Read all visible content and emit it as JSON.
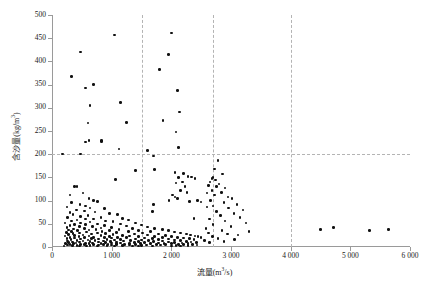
{
  "chart_data": {
    "type": "scatter",
    "title": "",
    "xlabel": "流量 (m³/s)",
    "ylabel": "含沙量 (kg/m³)",
    "xlabel_text": "流量",
    "xlabel_unit_base": "(m",
    "xlabel_unit_sup": "3",
    "xlabel_unit_tail": "/s)",
    "ylabel_text": "含沙量",
    "ylabel_unit_base": "(kg/m",
    "ylabel_unit_sup": "3",
    "ylabel_unit_tail": ")",
    "xlim": [
      0,
      6000
    ],
    "ylim": [
      0,
      500
    ],
    "xticks": [
      0,
      1000,
      2000,
      3000,
      4000,
      5000,
      6000
    ],
    "xtick_labels": [
      "0",
      "1 000",
      "2 000",
      "3 000",
      "4 000",
      "5 000",
      "6 000"
    ],
    "yticks": [
      0,
      50,
      100,
      150,
      200,
      250,
      300,
      350,
      400,
      450,
      500
    ],
    "ytick_labels": [
      "0",
      "50",
      "100",
      "150",
      "200",
      "250",
      "300",
      "350",
      "400",
      "450",
      "500"
    ],
    "grid": false,
    "legend": null,
    "marker": "filled-circle",
    "marker_color": "#111111",
    "axis_color": "#9a9a9a",
    "reference_lines": {
      "vertical": [
        {
          "x": 1500,
          "style": "dashed",
          "color": "#b4b4b4"
        },
        {
          "x": 2700,
          "style": "dashed",
          "color": "#b4b4b4"
        },
        {
          "x": 4000,
          "style": "dashed",
          "color": "#b4b4b4"
        }
      ],
      "horizontal": [
        {
          "y": 200,
          "style": "dashed",
          "color": "#b4b4b4"
        }
      ]
    },
    "points": [
      [
        480,
        420
      ],
      [
        330,
        367
      ],
      [
        560,
        343
      ],
      [
        700,
        350
      ],
      [
        1050,
        457
      ],
      [
        640,
        305
      ],
      [
        1150,
        312
      ],
      [
        600,
        267
      ],
      [
        1250,
        268
      ],
      [
        620,
        229
      ],
      [
        830,
        230
      ],
      [
        2000,
        461
      ],
      [
        1800,
        382
      ],
      [
        1950,
        415
      ],
      [
        2100,
        337
      ],
      [
        2140,
        291
      ],
      [
        1860,
        272
      ],
      [
        2080,
        248
      ],
      [
        2120,
        214
      ],
      [
        560,
        226
      ],
      [
        830,
        228
      ],
      [
        1120,
        211
      ],
      [
        1600,
        208
      ],
      [
        180,
        200
      ],
      [
        480,
        200
      ],
      [
        1700,
        196
      ],
      [
        1400,
        165
      ],
      [
        1720,
        167
      ],
      [
        1060,
        146
      ],
      [
        2060,
        160
      ],
      [
        2200,
        158
      ],
      [
        2120,
        150
      ],
      [
        2280,
        152
      ],
      [
        2340,
        151
      ],
      [
        2190,
        140
      ],
      [
        2400,
        148
      ],
      [
        2080,
        138
      ],
      [
        2230,
        131
      ],
      [
        2020,
        112
      ],
      [
        2060,
        108
      ],
      [
        2100,
        104
      ],
      [
        1960,
        100
      ],
      [
        2300,
        98
      ],
      [
        2440,
        100
      ],
      [
        2500,
        97
      ],
      [
        1700,
        92
      ],
      [
        1680,
        76
      ],
      [
        2380,
        61
      ],
      [
        2600,
        86
      ],
      [
        2150,
        122
      ],
      [
        2260,
        118
      ],
      [
        380,
        131
      ],
      [
        420,
        130
      ],
      [
        300,
        112
      ],
      [
        520,
        116
      ],
      [
        620,
        105
      ],
      [
        700,
        100
      ],
      [
        760,
        98
      ],
      [
        330,
        96
      ],
      [
        470,
        92
      ],
      [
        560,
        88
      ],
      [
        250,
        86
      ],
      [
        640,
        84
      ],
      [
        880,
        83
      ],
      [
        410,
        80
      ],
      [
        540,
        78
      ],
      [
        720,
        75
      ],
      [
        300,
        74
      ],
      [
        960,
        72
      ],
      [
        1100,
        70
      ],
      [
        350,
        70
      ],
      [
        600,
        68
      ],
      [
        480,
        66
      ],
      [
        820,
        64
      ],
      [
        260,
        64
      ],
      [
        1180,
        62
      ],
      [
        700,
        60
      ],
      [
        560,
        60
      ],
      [
        420,
        58
      ],
      [
        1280,
        58
      ],
      [
        900,
        56
      ],
      [
        330,
        56
      ],
      [
        1020,
        55
      ],
      [
        640,
        54
      ],
      [
        480,
        52
      ],
      [
        1400,
        52
      ],
      [
        220,
        52
      ],
      [
        760,
        50
      ],
      [
        1150,
        50
      ],
      [
        560,
        48
      ],
      [
        380,
        48
      ],
      [
        1500,
        47
      ],
      [
        880,
        46
      ],
      [
        300,
        46
      ],
      [
        1250,
        45
      ],
      [
        680,
        44
      ],
      [
        460,
        44
      ],
      [
        1600,
        43
      ],
      [
        1000,
        42
      ],
      [
        250,
        42
      ],
      [
        820,
        41
      ],
      [
        1350,
        40
      ],
      [
        540,
        40
      ],
      [
        1720,
        40
      ],
      [
        360,
        39
      ],
      [
        1120,
        38
      ],
      [
        740,
        38
      ],
      [
        1850,
        38
      ],
      [
        620,
        37
      ],
      [
        280,
        37
      ],
      [
        1450,
        36
      ],
      [
        960,
        36
      ],
      [
        430,
        35
      ],
      [
        1950,
        35
      ],
      [
        840,
        34
      ],
      [
        330,
        34
      ],
      [
        1280,
        33
      ],
      [
        1650,
        33
      ],
      [
        580,
        32
      ],
      [
        2050,
        32
      ],
      [
        1080,
        31
      ],
      [
        240,
        31
      ],
      [
        760,
        30
      ],
      [
        1520,
        30
      ],
      [
        460,
        30
      ],
      [
        2150,
        30
      ],
      [
        900,
        29
      ],
      [
        350,
        29
      ],
      [
        1380,
        28
      ],
      [
        660,
        28
      ],
      [
        1780,
        28
      ],
      [
        2250,
        28
      ],
      [
        1020,
        27
      ],
      [
        280,
        27
      ],
      [
        1600,
        26
      ],
      [
        520,
        26
      ],
      [
        2320,
        26
      ],
      [
        1180,
        25
      ],
      [
        820,
        25
      ],
      [
        380,
        25
      ],
      [
        1900,
        25
      ],
      [
        2400,
        24
      ],
      [
        1300,
        24
      ],
      [
        620,
        24
      ],
      [
        220,
        24
      ],
      [
        1720,
        23
      ],
      [
        960,
        23
      ],
      [
        2450,
        23
      ],
      [
        450,
        22
      ],
      [
        1450,
        22
      ],
      [
        2000,
        22
      ],
      [
        1100,
        21
      ],
      [
        700,
        21
      ],
      [
        300,
        21
      ],
      [
        1850,
        21
      ],
      [
        2500,
        21
      ],
      [
        1250,
        20
      ],
      [
        540,
        20
      ],
      [
        2100,
        20
      ],
      [
        880,
        20
      ],
      [
        1550,
        19
      ],
      [
        380,
        19
      ],
      [
        2200,
        19
      ],
      [
        1000,
        19
      ],
      [
        660,
        18
      ],
      [
        1680,
        18
      ],
      [
        250,
        18
      ],
      [
        2300,
        18
      ],
      [
        1400,
        17
      ],
      [
        780,
        17
      ],
      [
        1950,
        17
      ],
      [
        480,
        17
      ],
      [
        1150,
        16
      ],
      [
        2380,
        16
      ],
      [
        920,
        16
      ],
      [
        1780,
        16
      ],
      [
        320,
        16
      ],
      [
        600,
        15
      ],
      [
        1500,
        15
      ],
      [
        2050,
        15
      ],
      [
        1050,
        15
      ],
      [
        420,
        14
      ],
      [
        1320,
        14
      ],
      [
        720,
        14
      ],
      [
        2150,
        14
      ],
      [
        1620,
        14
      ],
      [
        260,
        13
      ],
      [
        860,
        13
      ],
      [
        1850,
        13
      ],
      [
        1200,
        13
      ],
      [
        520,
        13
      ],
      [
        2250,
        12
      ],
      [
        980,
        12
      ],
      [
        1450,
        12
      ],
      [
        640,
        12
      ],
      [
        1700,
        12
      ],
      [
        340,
        11
      ],
      [
        2330,
        11
      ],
      [
        1080,
        11
      ],
      [
        780,
        11
      ],
      [
        1950,
        11
      ],
      [
        460,
        11
      ],
      [
        1380,
        10
      ],
      [
        2420,
        10
      ],
      [
        900,
        10
      ],
      [
        1550,
        10
      ],
      [
        280,
        10
      ],
      [
        2050,
        10
      ],
      [
        1150,
        9
      ],
      [
        680,
        9
      ],
      [
        1780,
        9
      ],
      [
        400,
        9
      ],
      [
        2180,
        9
      ],
      [
        1000,
        9
      ],
      [
        1300,
        8
      ],
      [
        560,
        8
      ],
      [
        1880,
        8
      ],
      [
        230,
        8
      ],
      [
        2280,
        8
      ],
      [
        820,
        8
      ],
      [
        1480,
        7
      ],
      [
        1080,
        7
      ],
      [
        360,
        7
      ],
      [
        2000,
        7
      ],
      [
        620,
        7
      ],
      [
        1650,
        7
      ],
      [
        940,
        6
      ],
      [
        2120,
        6
      ],
      [
        1220,
        6
      ],
      [
        480,
        6
      ],
      [
        1750,
        6
      ],
      [
        300,
        6
      ],
      [
        2350,
        6
      ],
      [
        860,
        5
      ],
      [
        1400,
        5
      ],
      [
        1080,
        5
      ],
      [
        700,
        5
      ],
      [
        1900,
        5
      ],
      [
        2200,
        5
      ],
      [
        540,
        5
      ],
      [
        1580,
        4
      ],
      [
        260,
        4
      ],
      [
        1000,
        4
      ],
      [
        1300,
        4
      ],
      [
        2430,
        4
      ],
      [
        780,
        4
      ],
      [
        1820,
        4
      ],
      [
        420,
        3
      ],
      [
        2080,
        3
      ],
      [
        1180,
        3
      ],
      [
        640,
        3
      ],
      [
        1500,
        3
      ],
      [
        340,
        3
      ],
      [
        2280,
        3
      ],
      [
        920,
        3
      ],
      [
        1680,
        2
      ],
      [
        1350,
        2
      ],
      [
        580,
        2
      ],
      [
        2000,
        2
      ],
      [
        200,
        2
      ],
      [
        1050,
        2
      ],
      [
        2150,
        2
      ],
      [
        760,
        2
      ],
      [
        1450,
        2
      ],
      [
        460,
        2
      ],
      [
        2780,
        186
      ],
      [
        2720,
        168
      ],
      [
        2860,
        157
      ],
      [
        2700,
        150
      ],
      [
        2680,
        148
      ],
      [
        2740,
        144
      ],
      [
        2650,
        140
      ],
      [
        2800,
        136
      ],
      [
        2620,
        133
      ],
      [
        2760,
        130
      ],
      [
        2900,
        127
      ],
      [
        2680,
        122
      ],
      [
        2840,
        118
      ],
      [
        2600,
        116
      ],
      [
        2720,
        112
      ],
      [
        2950,
        108
      ],
      [
        3020,
        104
      ],
      [
        2660,
        100
      ],
      [
        2880,
        96
      ],
      [
        3100,
        92
      ],
      [
        2700,
        88
      ],
      [
        2960,
        84
      ],
      [
        3200,
        80
      ],
      [
        2760,
        76
      ],
      [
        3050,
        72
      ],
      [
        2820,
        68
      ],
      [
        3150,
        64
      ],
      [
        2640,
        60
      ],
      [
        2900,
        56
      ],
      [
        3250,
        52
      ],
      [
        2700,
        48
      ],
      [
        3000,
        44
      ],
      [
        2580,
        40
      ],
      [
        2850,
        36
      ],
      [
        3300,
        34
      ],
      [
        2620,
        30
      ],
      [
        2940,
        28
      ],
      [
        3120,
        26
      ],
      [
        2690,
        22
      ],
      [
        2780,
        18
      ],
      [
        3060,
        16
      ],
      [
        2560,
        14
      ],
      [
        2880,
        12
      ],
      [
        2640,
        10
      ],
      [
        4500,
        38
      ],
      [
        4720,
        42
      ],
      [
        5320,
        36
      ],
      [
        5640,
        38
      ]
    ]
  }
}
